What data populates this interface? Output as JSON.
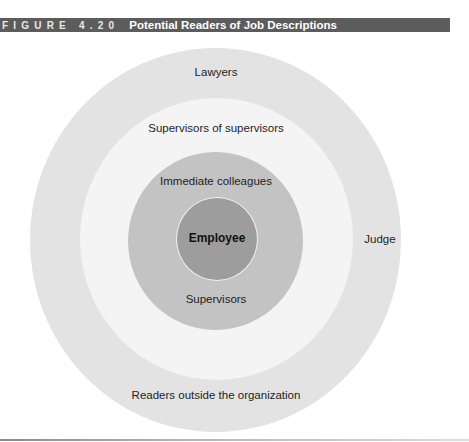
{
  "figure": {
    "label": "FIGURE",
    "number": "4.20",
    "title": "Potential Readers of Job Descriptions",
    "header_color": "#5c5c5c"
  },
  "diagram": {
    "type": "concentric-circles",
    "rings": [
      {
        "level": "outer",
        "fill": "#e3e3e3",
        "labels": {
          "top": "Lawyers",
          "right": "Judge",
          "bottom": "Readers outside the organization"
        }
      },
      {
        "level": "second",
        "fill": "#f4f4f4",
        "labels": {
          "top": "Supervisors of supervisors"
        }
      },
      {
        "level": "third",
        "fill": "#c3c3c3",
        "labels": {
          "top": "Immediate colleagues",
          "bottom": "Supervisors"
        }
      },
      {
        "level": "core",
        "fill": "#9d9d9d",
        "labels": {
          "center": "Employee"
        }
      }
    ]
  }
}
